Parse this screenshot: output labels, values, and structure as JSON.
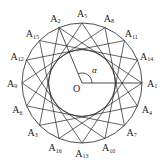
{
  "diagram": {
    "type": "star-polygon-on-circle",
    "point_count": 16,
    "step_angle_deg": 112.5,
    "center_label": "O",
    "angle_label": "α",
    "point_prefix": "A",
    "points": [
      {
        "label": "A",
        "index": "1",
        "angle_deg": 0
      },
      {
        "label": "A",
        "index": "2",
        "angle_deg": 112.5
      },
      {
        "label": "A",
        "index": "3",
        "angle_deg": 225
      },
      {
        "label": "A",
        "index": "4",
        "angle_deg": 337.5
      },
      {
        "label": "A",
        "index": "5",
        "angle_deg": 90
      },
      {
        "label": "A",
        "index": "6",
        "angle_deg": 202.5
      },
      {
        "label": "A",
        "index": "7",
        "angle_deg": 315
      },
      {
        "label": "A",
        "index": "8",
        "angle_deg": 67.5
      },
      {
        "label": "A",
        "index": "9",
        "angle_deg": 180
      },
      {
        "label": "A",
        "index": "10",
        "angle_deg": 292.5
      },
      {
        "label": "A",
        "index": "11",
        "angle_deg": 45
      },
      {
        "label": "A",
        "index": "12",
        "angle_deg": 157.5
      },
      {
        "label": "A",
        "index": "13",
        "angle_deg": 270
      },
      {
        "label": "A",
        "index": "14",
        "angle_deg": 22.5
      },
      {
        "label": "A",
        "index": "15",
        "angle_deg": 135
      },
      {
        "label": "A",
        "index": "16",
        "angle_deg": 247.5
      }
    ],
    "colors": {
      "stroke": "#222222",
      "background": "#ffffff"
    }
  }
}
